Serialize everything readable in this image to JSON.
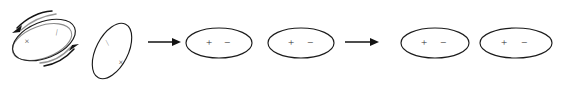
{
  "figure": {
    "width": 563,
    "height": 93,
    "background_color": "#ffffff",
    "stroke_color": "#1b1b1b",
    "glyph_color": "#2e2e2e"
  },
  "stages": [
    {
      "id": "stage-1-tilted-rotating",
      "label": "tilted ellipse with rotation arrows",
      "ellipse": {
        "cx": 44,
        "cy": 40,
        "rx": 33,
        "ry": 18,
        "rotation_deg": -22
      },
      "glyphs": [
        {
          "name": "cross-mark",
          "symbol": "×",
          "x": 27,
          "y": 42
        },
        {
          "name": "dash-mark",
          "symbol": "⁄",
          "x": 57,
          "y": 33
        }
      ],
      "rotation_arrows": [
        {
          "name": "rotation-arrow-upper-left",
          "direction": "down-left"
        },
        {
          "name": "rotation-arrow-lower-right",
          "direction": "up-right"
        }
      ]
    },
    {
      "id": "stage-2-steep-tilted",
      "label": "steeply tilted ellipse",
      "ellipse": {
        "cx": 112,
        "cy": 51,
        "rx": 30,
        "ry": 16,
        "rotation_deg": -63
      },
      "glyphs": [
        {
          "name": "dash-mark",
          "symbol": "⁄",
          "x": 108,
          "y": 43
        },
        {
          "name": "cross-mark",
          "symbol": "×",
          "x": 120,
          "y": 63
        }
      ],
      "rotation_arrows": []
    },
    {
      "id": "stage-3-aligned-first",
      "label": "horizontal ellipse with plus and minus",
      "ellipse": {
        "cx": 219,
        "cy": 43,
        "rx": 33,
        "ry": 15,
        "rotation_deg": 0
      },
      "glyphs": [
        {
          "name": "plus-sign",
          "symbol": "+",
          "x": 209,
          "y": 43
        },
        {
          "name": "minus-sign",
          "symbol": "−",
          "x": 227,
          "y": 43
        }
      ],
      "rotation_arrows": []
    },
    {
      "id": "stage-4-aligned-second",
      "label": "horizontal ellipse with plus and minus",
      "ellipse": {
        "cx": 301,
        "cy": 43,
        "rx": 33,
        "ry": 15,
        "rotation_deg": 0
      },
      "glyphs": [
        {
          "name": "plus-sign",
          "symbol": "+",
          "x": 291,
          "y": 43
        },
        {
          "name": "minus-sign",
          "symbol": "−",
          "x": 310,
          "y": 43
        }
      ],
      "rotation_arrows": []
    },
    {
      "id": "stage-5-aligned-third",
      "label": "horizontal ellipse with plus and minus",
      "ellipse": {
        "cx": 435,
        "cy": 43,
        "rx": 34,
        "ry": 15,
        "rotation_deg": 0
      },
      "glyphs": [
        {
          "name": "plus-sign",
          "symbol": "+",
          "x": 424,
          "y": 43
        },
        {
          "name": "minus-sign",
          "symbol": "−",
          "x": 443,
          "y": 43
        }
      ],
      "rotation_arrows": []
    },
    {
      "id": "stage-6-aligned-fourth",
      "label": "horizontal ellipse with plus and minus",
      "ellipse": {
        "cx": 516,
        "cy": 43,
        "rx": 36,
        "ry": 15,
        "rotation_deg": 0
      },
      "glyphs": [
        {
          "name": "plus-sign",
          "symbol": "+",
          "x": 504,
          "y": 43
        },
        {
          "name": "minus-sign",
          "symbol": "−",
          "x": 524,
          "y": 43
        }
      ],
      "rotation_arrows": []
    }
  ],
  "transition_arrows": [
    {
      "id": "transition-arrow-1",
      "label": "rightward arrow",
      "x1": 148,
      "x2": 180,
      "y": 42
    },
    {
      "id": "transition-arrow-2",
      "label": "rightward arrow",
      "x1": 345,
      "x2": 378,
      "y": 42
    }
  ]
}
